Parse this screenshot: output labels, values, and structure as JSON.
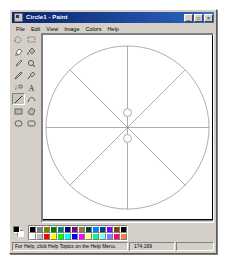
{
  "window": {
    "title": "Circle1 - Paint",
    "icon": "paint-app-icon",
    "controls": [
      {
        "name": "minimize",
        "glyph": "_"
      },
      {
        "name": "maximize",
        "glyph": "□"
      },
      {
        "name": "close",
        "glyph": "×"
      }
    ]
  },
  "menu": {
    "items": [
      {
        "label": "File"
      },
      {
        "label": "Edit"
      },
      {
        "label": "View"
      },
      {
        "label": "Image"
      },
      {
        "label": "Colors"
      },
      {
        "label": "Help"
      }
    ]
  },
  "tools": {
    "selected": "line",
    "items": [
      {
        "name": "free-form-select",
        "label": "Free-Form Select"
      },
      {
        "name": "select",
        "label": "Select"
      },
      {
        "name": "eraser",
        "label": "Eraser/Color Eraser"
      },
      {
        "name": "fill-with-color",
        "label": "Fill With Color"
      },
      {
        "name": "pick-color",
        "label": "Pick Color"
      },
      {
        "name": "magnifier",
        "label": "Magnifier"
      },
      {
        "name": "pencil",
        "label": "Pencil"
      },
      {
        "name": "brush",
        "label": "Brush"
      },
      {
        "name": "airbrush",
        "label": "Airbrush"
      },
      {
        "name": "text",
        "label": "Text"
      },
      {
        "name": "line",
        "label": "Line"
      },
      {
        "name": "curve",
        "label": "Curve"
      },
      {
        "name": "rectangle",
        "label": "Rectangle"
      },
      {
        "name": "polygon",
        "label": "Polygon"
      },
      {
        "name": "ellipse",
        "label": "Ellipse"
      },
      {
        "name": "rounded-rectangle",
        "label": "Rounded Rectangle"
      }
    ]
  },
  "drawing": {
    "description": "Circle divided into eight sectors with two small circles on the vertical axis",
    "stroke_color": "#808080",
    "background": "#ffffff",
    "shapes": [
      {
        "type": "circle",
        "name": "outer-circle",
        "cx": 85,
        "cy": 93,
        "r": 82
      },
      {
        "type": "line",
        "name": "vertical-diameter",
        "x1": 85,
        "y1": 11,
        "x2": 85,
        "y2": 175
      },
      {
        "type": "line",
        "name": "horizontal-diameter",
        "x1": 3,
        "y1": 93,
        "x2": 167,
        "y2": 93
      },
      {
        "type": "line",
        "name": "diagonal-down-right",
        "x1": 27,
        "y1": 35,
        "x2": 143,
        "y2": 151
      },
      {
        "type": "line",
        "name": "diagonal-up-right",
        "x1": 27,
        "y1": 151,
        "x2": 143,
        "y2": 35
      },
      {
        "type": "circle",
        "name": "upper-small-circle",
        "cx": 85,
        "cy": 78,
        "r": 4
      },
      {
        "type": "circle",
        "name": "lower-small-circle",
        "cx": 85,
        "cy": 104,
        "r": 4
      }
    ]
  },
  "colors": {
    "foreground": "#000000",
    "background": "#ffffff",
    "palette_row1": [
      "#000000",
      "#808080",
      "#808000",
      "#008000",
      "#008080",
      "#000080",
      "#800080",
      "#808040",
      "#004040",
      "#0080ff",
      "#004080",
      "#8000ff",
      "#804000",
      "#000000"
    ],
    "palette_row2": [
      "#ffffff",
      "#c0c0c0",
      "#ff0000",
      "#ffff00",
      "#00ff00",
      "#00ffff",
      "#0000ff",
      "#ff00ff",
      "#ffff80",
      "#00ff80",
      "#80ffff",
      "#8080ff",
      "#ff0080",
      "#ff8040"
    ]
  },
  "status": {
    "help_text": "For Help, click Help Topics on the Help Menu.",
    "coordinates": "174,169",
    "size": ""
  }
}
